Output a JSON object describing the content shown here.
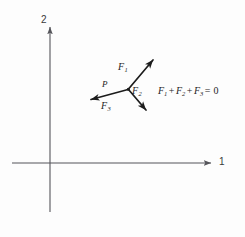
{
  "figure": {
    "background_color": "#fdfdfd",
    "ink_color": "#1c1c1c",
    "axis_color": "#55555a",
    "axes": {
      "vertical_label": "2",
      "horizontal_label": "1",
      "origin": {
        "x": 50,
        "y": 163
      },
      "vertical_top": {
        "x": 50,
        "y": 25
      },
      "vertical_bottom": {
        "x": 50,
        "y": 212
      },
      "horizontal_right": {
        "x": 213,
        "y": 163
      },
      "horizontal_left": {
        "x": 12,
        "y": 163
      }
    },
    "concurrency_point": {
      "label": "P",
      "x": 128,
      "y": 89
    },
    "vectors": [
      {
        "label": "F",
        "subscript": "1",
        "from": {
          "x": 128,
          "y": 89
        },
        "to": {
          "x": 156,
          "y": 57
        },
        "label_pos": {
          "x": 118,
          "y": 62
        }
      },
      {
        "label": "F",
        "subscript": "2",
        "from": {
          "x": 128,
          "y": 89
        },
        "to": {
          "x": 149,
          "y": 114
        },
        "label_pos": {
          "x": 132,
          "y": 86
        }
      },
      {
        "label": "F",
        "subscript": "3",
        "from": {
          "x": 128,
          "y": 89
        },
        "to": {
          "x": 87,
          "y": 101
        },
        "label_pos": {
          "x": 101,
          "y": 101
        }
      }
    ],
    "equation": {
      "terms": [
        {
          "symbol": "F",
          "subscript": "1"
        },
        {
          "symbol": "F",
          "subscript": "2"
        },
        {
          "symbol": "F",
          "subscript": "3"
        }
      ],
      "operator": "+",
      "equals": "=",
      "result": "0",
      "full_text": "F1 + F2 + F3 = 0"
    }
  }
}
